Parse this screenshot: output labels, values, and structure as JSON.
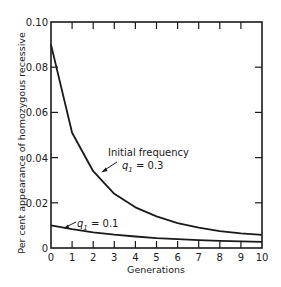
{
  "chart_data": {
    "type": "line",
    "title": "",
    "xlabel": "Generations",
    "ylabel": "Per cent appearance of homozygous recessive",
    "x": [
      0,
      1,
      2,
      3,
      4,
      5,
      6,
      7,
      8,
      9,
      10
    ],
    "xticks": [
      "0",
      "1",
      "2",
      "3",
      "4",
      "5",
      "6",
      "7",
      "8",
      "9",
      "10"
    ],
    "yticks": [
      "0",
      "0.02",
      "0.04",
      "0.06",
      "0.08",
      "0.10"
    ],
    "ytick_values": [
      0,
      0.02,
      0.04,
      0.06,
      0.08,
      0.1
    ],
    "xlim": [
      0,
      10
    ],
    "ylim": [
      0,
      0.1
    ],
    "grid": false,
    "legend": "none",
    "series": [
      {
        "name": "q1 = 0.3",
        "values": [
          0.09,
          0.051,
          0.034,
          0.024,
          0.018,
          0.014,
          0.011,
          0.009,
          0.0075,
          0.0065,
          0.0058
        ]
      },
      {
        "name": "q1 = 0.1",
        "values": [
          0.01,
          0.0083,
          0.0069,
          0.0059,
          0.0051,
          0.0044,
          0.0039,
          0.0035,
          0.0032,
          0.0029,
          0.0027
        ]
      }
    ],
    "annotations": [
      {
        "text_line1": "Initial frequency",
        "text_line2_var": "q",
        "text_line2_sub": "1",
        "text_line2_rest": " = 0.3",
        "series": 0
      },
      {
        "text_var": "q",
        "text_sub": "1",
        "text_rest": " = 0.1",
        "series": 1
      }
    ]
  }
}
